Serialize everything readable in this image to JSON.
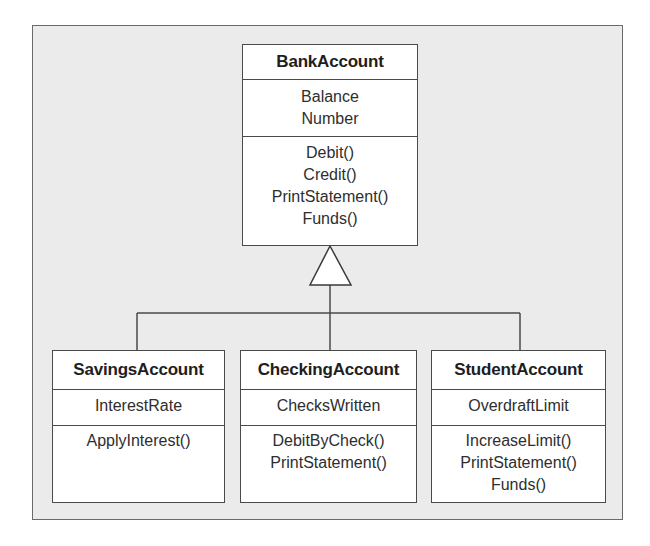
{
  "diagram": {
    "type": "UML class diagram (inheritance)",
    "colors": {
      "frame_background": "#ebebeb",
      "box_background": "#ffffff",
      "line": "#4a4a4a",
      "text": "#2a2a2a"
    },
    "base_class": {
      "name": "BankAccount",
      "attributes": [
        "Balance",
        "Number"
      ],
      "methods": [
        "Debit()",
        "Credit()",
        "PrintStatement()",
        "Funds()"
      ]
    },
    "subclasses": [
      {
        "name": "SavingsAccount",
        "attributes": [
          "InterestRate"
        ],
        "methods": [
          "ApplyInterest()"
        ]
      },
      {
        "name": "CheckingAccount",
        "attributes": [
          "ChecksWritten"
        ],
        "methods": [
          "DebitByCheck()",
          "PrintStatement()"
        ]
      },
      {
        "name": "StudentAccount",
        "attributes": [
          "OverdraftLimit"
        ],
        "methods": [
          "IncreaseLimit()",
          "PrintStatement()",
          "Funds()"
        ]
      }
    ],
    "relationships": [
      {
        "from": "SavingsAccount",
        "to": "BankAccount",
        "type": "generalization"
      },
      {
        "from": "CheckingAccount",
        "to": "BankAccount",
        "type": "generalization"
      },
      {
        "from": "StudentAccount",
        "to": "BankAccount",
        "type": "generalization"
      }
    ]
  }
}
